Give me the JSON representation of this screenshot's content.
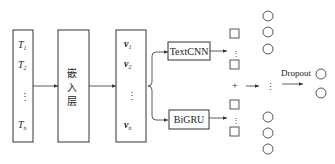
{
  "diagram": {
    "input_box": {
      "tokens": [
        "T",
        "T",
        "T"
      ],
      "subscripts": [
        "1",
        "2",
        "n"
      ],
      "ellipsis": "⋮"
    },
    "embedding_box": {
      "label_chars": [
        "嵌",
        "入",
        "层"
      ]
    },
    "vector_box": {
      "vectors": [
        "v",
        "v",
        "v"
      ],
      "subscripts": [
        "1",
        "2",
        "n"
      ],
      "ellipsis": "⋮"
    },
    "branches": {
      "top": "TextCNN",
      "bottom": "BiGRU"
    },
    "merge_symbol": "+",
    "merged_ellipsis": "⋮",
    "dropout_label": "Dropout",
    "colors": {
      "stroke": "#333333",
      "background": "#ffffff"
    }
  }
}
